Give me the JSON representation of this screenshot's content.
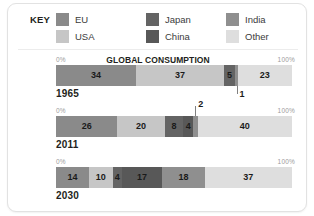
{
  "legend": {
    "title": "KEY",
    "items": [
      {
        "label": "EU",
        "color": "#8a8a8a",
        "col": 0,
        "row": 0
      },
      {
        "label": "USA",
        "color": "#c6c6c6",
        "col": 0,
        "row": 1
      },
      {
        "label": "Japan",
        "color": "#646464",
        "col": 1,
        "row": 0
      },
      {
        "label": "China",
        "color": "#585858",
        "col": 1,
        "row": 1
      },
      {
        "label": "India",
        "color": "#8f8f8f",
        "col": 2,
        "row": 0
      },
      {
        "label": "Other",
        "color": "#dedede",
        "col": 2,
        "row": 1
      }
    ]
  },
  "chart_data": {
    "type": "bar",
    "title": "GLOBAL CONSUMPTION",
    "subtitle": "",
    "orientation": "horizontal-stacked",
    "unit": "%",
    "axis_min_label": "0%",
    "axis_max_label": "100%",
    "xlabel": "",
    "ylabel": "",
    "xlim": [
      0,
      100
    ],
    "grid": false,
    "legend_position": "top",
    "categories": [
      "EU",
      "USA",
      "Japan",
      "China",
      "India",
      "Other"
    ],
    "series": [
      {
        "name": "1965",
        "values": [
          34,
          37,
          5,
          0,
          1,
          23
        ],
        "segments": [
          {
            "category": "EU",
            "value": 34,
            "label": "34",
            "color": "#8a8a8a",
            "label_mode": "inside"
          },
          {
            "category": "USA",
            "value": 37,
            "label": "37",
            "color": "#c6c6c6",
            "label_mode": "inside"
          },
          {
            "category": "Japan",
            "value": 5,
            "label": "5",
            "color": "#646464",
            "label_mode": "inside"
          },
          {
            "category": "India",
            "value": 1,
            "label": "1",
            "color": "#8f8f8f",
            "label_mode": "callout"
          },
          {
            "category": "Other",
            "value": 23,
            "label": "23",
            "color": "#dedede",
            "label_mode": "inside"
          }
        ]
      },
      {
        "name": "2011",
        "values": [
          26,
          20,
          8,
          4,
          2,
          40
        ],
        "segments": [
          {
            "category": "EU",
            "value": 26,
            "label": "26",
            "color": "#8a8a8a",
            "label_mode": "inside"
          },
          {
            "category": "USA",
            "value": 20,
            "label": "20",
            "color": "#c6c6c6",
            "label_mode": "inside"
          },
          {
            "category": "Japan",
            "value": 8,
            "label": "8",
            "color": "#646464",
            "label_mode": "inside"
          },
          {
            "category": "China",
            "value": 4,
            "label": "4",
            "color": "#585858",
            "label_mode": "inside"
          },
          {
            "category": "India",
            "value": 2,
            "label": "2",
            "color": "#8f8f8f",
            "label_mode": "callout"
          },
          {
            "category": "Other",
            "value": 40,
            "label": "40",
            "color": "#dedede",
            "label_mode": "inside"
          }
        ]
      },
      {
        "name": "2030",
        "values": [
          14,
          10,
          4,
          17,
          18,
          37
        ],
        "segments": [
          {
            "category": "EU",
            "value": 14,
            "label": "14",
            "color": "#8a8a8a",
            "label_mode": "inside"
          },
          {
            "category": "USA",
            "value": 10,
            "label": "10",
            "color": "#c6c6c6",
            "label_mode": "inside"
          },
          {
            "category": "Japan",
            "value": 4,
            "label": "4",
            "color": "#646464",
            "label_mode": "inside"
          },
          {
            "category": "China",
            "value": 17,
            "label": "17",
            "color": "#585858",
            "label_mode": "inside"
          },
          {
            "category": "India",
            "value": 18,
            "label": "18",
            "color": "#8f8f8f",
            "label_mode": "inside"
          },
          {
            "category": "Other",
            "value": 37,
            "label": "37",
            "color": "#dedede",
            "label_mode": "inside"
          }
        ]
      }
    ]
  }
}
